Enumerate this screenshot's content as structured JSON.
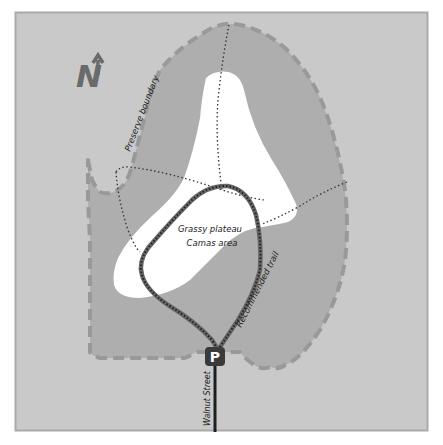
{
  "map": {
    "colors": {
      "frame_background": "#c9c9c9",
      "frame_border": "#a9a9a9",
      "preserve_fill": "#aeaeae",
      "preserve_boundary": "#999999",
      "plateau_fill": "#ffffff",
      "dotted_path": "#333333",
      "trail_casing": "#666666",
      "trail_dots": "#222222",
      "street": "#1e1e1e",
      "parking_badge": "#3a3a3a",
      "north_arrow": "#6a6a6a"
    },
    "north_arrow": {
      "icon": "north-arrow-icon",
      "letter": "N"
    },
    "labels": {
      "preserve_boundary": "Preserve boundary",
      "plateau_line1": "Grassy plateau",
      "plateau_line2": "Camas area",
      "recommended_trail": "Recommended trail",
      "street": "Walnut Street"
    },
    "parking": {
      "icon": "parking-icon",
      "letter": "P"
    }
  }
}
